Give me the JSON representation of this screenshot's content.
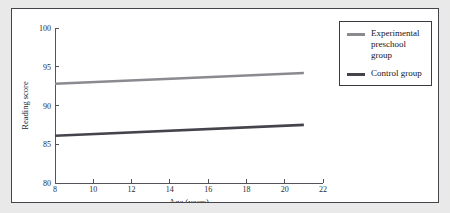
{
  "figure": {
    "background": "#ffffff",
    "page_background": "#e9e9e9",
    "border_color": "#44444a"
  },
  "legend": {
    "position": "top-right",
    "border_color": "#3a3a40",
    "entries": [
      {
        "label": "Experimental\npreschool group",
        "color": "#8a8a90",
        "swatch_name": "legend-swatch-experimental"
      },
      {
        "label": "Control group",
        "color": "#44444c",
        "swatch_name": "legend-swatch-control"
      }
    ]
  },
  "chart_data": {
    "type": "line",
    "title": "",
    "xlabel": "Age (years)",
    "ylabel": "Reading score",
    "xlim": [
      8,
      22
    ],
    "ylim": [
      80,
      100
    ],
    "xticks": [
      8,
      10,
      12,
      14,
      16,
      18,
      20,
      22
    ],
    "yticks": [
      80,
      85,
      90,
      95,
      100
    ],
    "xtick_labels": [
      "8",
      "10",
      "12",
      "14",
      "16",
      "18",
      "20",
      "22"
    ],
    "ytick_labels": [
      "80",
      "85",
      "90",
      "95",
      "100"
    ],
    "grid": false,
    "legend_position": "upper right",
    "series": [
      {
        "name": "Experimental preschool group",
        "color": "#8a8a90",
        "x": [
          8,
          21
        ],
        "values": [
          92.8,
          94.2
        ]
      },
      {
        "name": "Control group",
        "color": "#44444c",
        "x": [
          8,
          21
        ],
        "values": [
          86.1,
          87.5
        ]
      }
    ]
  }
}
